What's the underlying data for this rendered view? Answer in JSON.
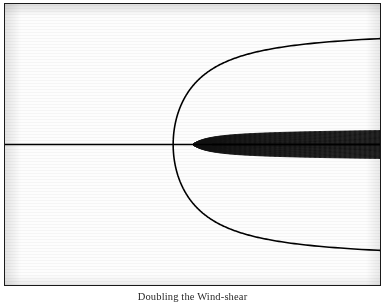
{
  "figure": {
    "caption": "Doubling the Wind-shear",
    "frame": {
      "border_color": "#1a1a1a",
      "background_color": "#fdfdfd"
    },
    "ink_color": "#111111"
  },
  "chart_data": {
    "type": "line",
    "title": "",
    "subtitle": "",
    "xlabel": "",
    "ylabel": "",
    "grid": false,
    "legend": null,
    "axis_ticks_visible": false,
    "xlim": [
      -3.2,
      3.2
    ],
    "ylim": [
      -1.25,
      1.25
    ],
    "stagnation_point": {
      "x": 0.35,
      "y": 0.0
    },
    "source_strength": 0.33,
    "freestream_velocity": 1.0,
    "n_streamlines": 61,
    "stream_function_values": [
      -3.0,
      -2.9,
      -2.8,
      -2.7,
      -2.6,
      -2.5,
      -2.4,
      -2.3,
      -2.2,
      -2.1,
      -2.0,
      -1.9,
      -1.8,
      -1.7,
      -1.6,
      -1.5,
      -1.4,
      -1.3,
      -1.2,
      -1.1,
      -1.0,
      -0.9,
      -0.8,
      -0.7,
      -0.6,
      -0.5,
      -0.4,
      -0.3,
      -0.2,
      -0.1,
      0.0,
      0.1,
      0.2,
      0.3,
      0.4,
      0.5,
      0.6,
      0.7,
      0.8,
      0.9,
      1.0,
      1.1,
      1.2,
      1.3,
      1.4,
      1.5,
      1.6,
      1.7,
      1.8,
      1.9,
      2.0,
      2.1,
      2.2,
      2.3,
      2.4,
      2.5,
      2.6,
      2.7,
      2.8,
      2.9,
      3.0
    ],
    "series": [
      {
        "name": "streamlines",
        "kind": "contour",
        "color": "#111111",
        "linewidth": 0.9
      },
      {
        "name": "dividing-streamline",
        "kind": "contour",
        "color": "#000000",
        "linewidth": 1.6,
        "value": 0.0
      }
    ],
    "shear": {
      "enabled": true,
      "description": "Streamlines are slightly inclined, dipping from upper-left toward lower-right, indicating superposed vertical shear of the oncoming stream.",
      "slope": -0.055
    }
  }
}
